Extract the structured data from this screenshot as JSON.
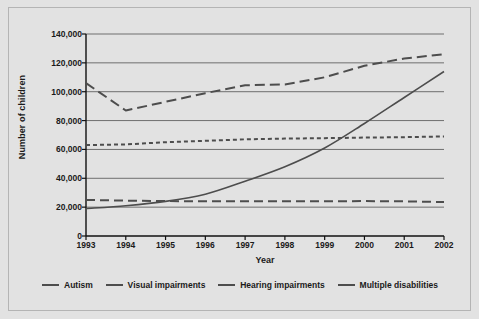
{
  "chart_data": {
    "type": "line",
    "title": "",
    "xlabel": "Year",
    "ylabel": "Number of children",
    "x": [
      1993,
      1994,
      1995,
      1996,
      1997,
      1998,
      1999,
      2000,
      2001,
      2002
    ],
    "xticklabels": [
      "1993",
      "1994",
      "1995",
      "1996",
      "1997",
      "1998",
      "1999",
      "2000",
      "2001",
      "2002"
    ],
    "yticklabels": [
      "0",
      "20,000",
      "40,000",
      "60,000",
      "80,000",
      "100,000",
      "120,000",
      "140,000"
    ],
    "ytickvalues": [
      0,
      20000,
      40000,
      60000,
      80000,
      100000,
      120000,
      140000
    ],
    "ylim": [
      0,
      140000
    ],
    "xlim": [
      1993,
      2002
    ],
    "grid": "horizontal",
    "legend_position": "bottom",
    "series": [
      {
        "name": "Autism",
        "style": "solid",
        "color": "#4d4d4d",
        "values": [
          19000,
          21000,
          24000,
          29000,
          38000,
          48000,
          61000,
          78000,
          96000,
          114000
        ]
      },
      {
        "name": "Visual impairments",
        "style": "long-dash",
        "color": "#4d4d4d",
        "values": [
          25000,
          24500,
          24200,
          24000,
          24000,
          24000,
          24000,
          24200,
          24000,
          23500
        ]
      },
      {
        "name": "Hearing impairments",
        "style": "short-dash",
        "color": "#4d4d4d",
        "values": [
          63000,
          63500,
          65000,
          66000,
          67000,
          67500,
          67800,
          68200,
          68500,
          69000
        ]
      },
      {
        "name": "Multiple disabilities",
        "style": "dashed",
        "color": "#4d4d4d",
        "values": [
          106000,
          87000,
          93000,
          99000,
          104500,
          105000,
          110000,
          118000,
          123000,
          126000
        ]
      }
    ]
  },
  "axes": {
    "ylabel": "Number of children",
    "xlabel": "Year"
  },
  "legend": {
    "items": [
      {
        "label": "Autism"
      },
      {
        "label": "Visual impairments"
      },
      {
        "label": "Hearing impairments"
      },
      {
        "label": "Multiple disabilities"
      }
    ]
  }
}
